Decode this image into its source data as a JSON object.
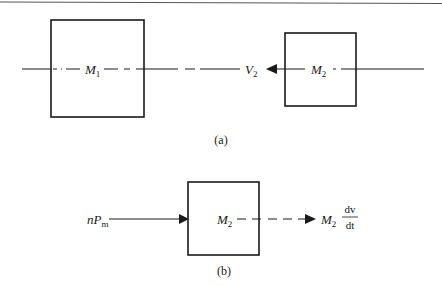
{
  "figure": {
    "colors": {
      "ink": "#1a1a1a",
      "rule": "#555555",
      "background": "#ffffff"
    },
    "panel_a": {
      "caption": "(a)",
      "mass1": {
        "symbol": "M",
        "subscript": "1"
      },
      "mass2": {
        "symbol": "M",
        "subscript": "2"
      },
      "velocity": {
        "symbol": "V",
        "subscript": "2"
      },
      "arrow_direction": "left"
    },
    "panel_b": {
      "caption": "(b)",
      "force_in": {
        "prefix": "n",
        "symbol": "P",
        "subscript": "m"
      },
      "mass": {
        "symbol": "M",
        "subscript": "2"
      },
      "output": {
        "symbol": "M",
        "subscript": "2",
        "numerator": "dv",
        "denominator": "dt"
      },
      "arrow_direction": "right"
    }
  }
}
